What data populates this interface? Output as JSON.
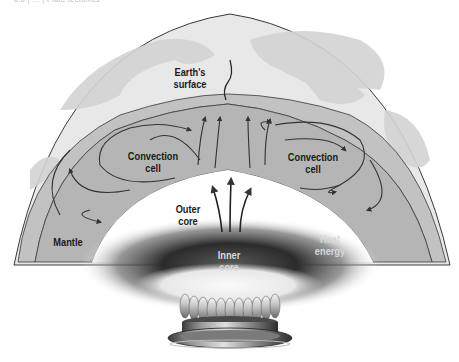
{
  "header": {
    "caption_cutoff": "8.8 | ... | Plate tectonics"
  },
  "diagram": {
    "colors": {
      "globe_surface": "#e6e6e6",
      "globe_continents": "#cfcfcf",
      "crust_band": "#bdbdbd",
      "mantle": "#b3b3b3",
      "outline": "#3a3a3a",
      "heat_dark": "#2a2a2a",
      "arrow": "#333333"
    },
    "labels": {
      "earth_surface_line1": "Earth's",
      "earth_surface_line2": "surface",
      "convection_left_line1": "Convection",
      "convection_left_line2": "cell",
      "convection_right_line1": "Convection",
      "convection_right_line2": "cell",
      "mantle": "Mantle",
      "outer_core_line1": "Outer",
      "outer_core_line2": "core",
      "inner_core_line1": "Inner",
      "inner_core_line2": "core",
      "heat_line1": "Heat",
      "heat_line2": "energy"
    },
    "icons": {
      "burner": "gas-burner-icon",
      "flame": "flame-icon"
    }
  }
}
